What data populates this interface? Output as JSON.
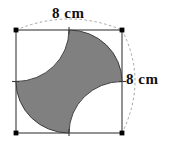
{
  "figure": {
    "type": "geometry-diagram",
    "shape_name": "square-with-astroid",
    "square": {
      "side_length_value": "8",
      "side_length_unit": "cm",
      "x": 16,
      "y": 30,
      "width": 106,
      "height": 103,
      "stroke_color": "#3a3a3a",
      "fill_color": "#ffffff",
      "corner_marker_color": "#000000"
    },
    "star": {
      "fill_color": "#808080",
      "stroke_color": "#333333",
      "cusp_count": 4,
      "arc_radius_ratio": 0.5
    },
    "dimensions": [
      {
        "id": "top-dimension",
        "label": "8 cm",
        "position": "top",
        "arc_style": "dashed"
      },
      {
        "id": "right-dimension",
        "label": "8 cm",
        "position": "right",
        "arc_style": "dashed"
      }
    ],
    "guide_color": "#9a9a9a",
    "background_color": "#ffffff"
  }
}
